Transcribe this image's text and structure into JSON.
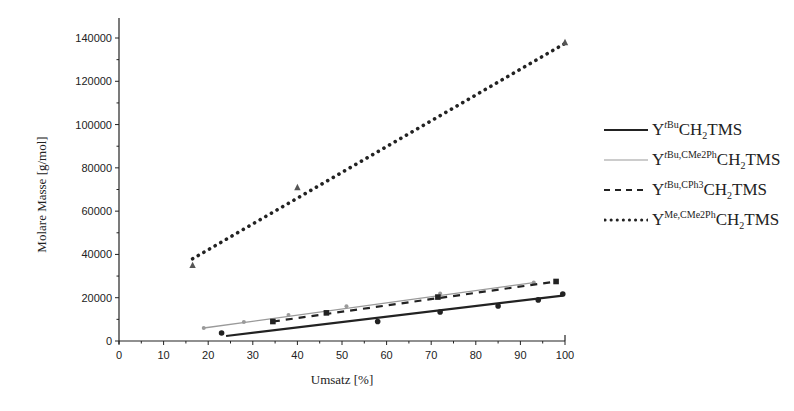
{
  "chart_data": {
    "type": "line",
    "title": "",
    "xlabel": "Umsatz [%]",
    "ylabel": "Molare Masse [g/mol]",
    "xlim": [
      0,
      100
    ],
    "ylim": [
      0,
      140000
    ],
    "x_ticks": [
      0,
      10,
      20,
      30,
      40,
      50,
      60,
      70,
      80,
      90,
      100
    ],
    "y_ticks": [
      0,
      20000,
      40000,
      60000,
      80000,
      100000,
      120000,
      140000
    ],
    "grid": false,
    "legend_position": "right",
    "series": [
      {
        "name": "Y^tBu CH2TMS",
        "style": "solid-black",
        "marker": "circle",
        "points": [
          [
            23,
            3700
          ],
          [
            58,
            9000
          ],
          [
            72,
            13400
          ],
          [
            85,
            16200
          ],
          [
            94,
            19000
          ],
          [
            99.5,
            21700
          ]
        ],
        "fit": [
          [
            24,
            2300
          ],
          [
            99.5,
            21000
          ]
        ]
      },
      {
        "name": "Y^tBu,CMe2Ph CH2TMS",
        "style": "solid-gray",
        "marker": "small-dot",
        "points": [
          [
            19,
            6000
          ],
          [
            28,
            8800
          ],
          [
            38,
            12000
          ],
          [
            51,
            16000
          ],
          [
            72,
            22000
          ],
          [
            93,
            27000
          ]
        ],
        "fit": [
          [
            19,
            6000
          ],
          [
            93,
            27000
          ]
        ]
      },
      {
        "name": "Y^tBu,CPh3 CH2TMS",
        "style": "dashed-black",
        "marker": "square",
        "points": [
          [
            34.5,
            9000
          ],
          [
            46.5,
            13000
          ],
          [
            71.5,
            20300
          ],
          [
            98,
            27500
          ]
        ],
        "fit": [
          [
            34.5,
            9000
          ],
          [
            98,
            27500
          ]
        ]
      },
      {
        "name": "Y^Me,CMe2Ph CH2TMS",
        "style": "dotted-black",
        "marker": "triangle",
        "points": [
          [
            16.5,
            35000
          ],
          [
            40,
            71000
          ],
          [
            100,
            138000
          ]
        ],
        "fit": [
          [
            16.5,
            38000
          ],
          [
            100,
            137500
          ]
        ]
      }
    ]
  },
  "axes": {
    "xlabel": "Umsatz [%]",
    "ylabel": "Molare Masse [g/mol]",
    "x_tick_labels": [
      "0",
      "10",
      "20",
      "30",
      "40",
      "50",
      "60",
      "70",
      "80",
      "90",
      "100"
    ],
    "y_tick_labels": [
      "0",
      "20000",
      "40000",
      "60000",
      "80000",
      "100000",
      "120000",
      "140000"
    ]
  },
  "legend": {
    "items": [
      {
        "base": "Y",
        "sup_italic": "t",
        "sup": "Bu",
        "mid": "CH",
        "sub": "2",
        "tail": "TMS"
      },
      {
        "base": "Y",
        "sup_italic": "t",
        "sup": "Bu,CMe2Ph",
        "mid": "CH",
        "sub": "2",
        "tail": "TMS"
      },
      {
        "base": "Y",
        "sup_italic": "t",
        "sup": "Bu,CPh3",
        "mid": "CH",
        "sub": "2",
        "tail": "TMS"
      },
      {
        "base": "Y",
        "sup_italic": "",
        "sup": "Me,CMe2Ph",
        "mid": "CH",
        "sub": "2",
        "tail": "TMS"
      }
    ]
  },
  "colors": {
    "black": "#222222",
    "gray": "#9a9a9a"
  }
}
